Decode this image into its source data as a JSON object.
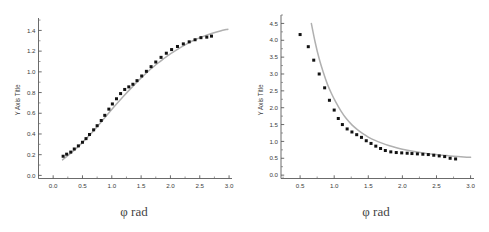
{
  "figure": {
    "background": "#ffffff",
    "marker_color": "#121212",
    "curve_color": "#b0b0b0",
    "axis_color": "#5a5a5a",
    "panel_count": 2
  },
  "chart_data": [
    {
      "id": "left-panel",
      "type": "scatter",
      "title": "",
      "subtitle": "",
      "xlabel": "φ rad",
      "ylabel": "Y Axis Title",
      "xlim": [
        -0.25,
        3.05
      ],
      "ylim": [
        -0.03,
        1.52
      ],
      "xticks": [
        "0.0",
        "0.5",
        "1.0",
        "1.5",
        "2.0",
        "2.5",
        "3.0"
      ],
      "xtick_values": [
        0.0,
        0.5,
        1.0,
        1.5,
        2.0,
        2.5,
        3.0
      ],
      "yticks": [
        "0.0",
        "0.2",
        "0.4",
        "0.6",
        "0.8",
        "1.0",
        "1.2",
        "1.4"
      ],
      "ytick_values": [
        0.0,
        0.2,
        0.4,
        0.6,
        0.8,
        1.0,
        1.2,
        1.4
      ],
      "minor_ticks": true,
      "grid": false,
      "legend": "none",
      "axes_style": "L-shaped spines, inward ticks",
      "series": [
        {
          "name": "data points",
          "style": "scatter",
          "marker": "filled-square",
          "color": "#121212",
          "x": [
            0.17,
            0.23,
            0.3,
            0.36,
            0.43,
            0.5,
            0.56,
            0.62,
            0.69,
            0.75,
            0.82,
            0.88,
            0.95,
            1.01,
            1.08,
            1.15,
            1.22,
            1.29,
            1.36,
            1.43,
            1.51,
            1.59,
            1.67,
            1.75,
            1.84,
            1.93,
            2.02,
            2.12,
            2.22,
            2.32,
            2.42,
            2.52,
            2.62,
            2.7
          ],
          "y": [
            0.185,
            0.205,
            0.225,
            0.255,
            0.285,
            0.32,
            0.355,
            0.395,
            0.44,
            0.48,
            0.53,
            0.58,
            0.64,
            0.69,
            0.74,
            0.79,
            0.83,
            0.855,
            0.88,
            0.915,
            0.96,
            1.005,
            1.05,
            1.095,
            1.14,
            1.18,
            1.215,
            1.245,
            1.27,
            1.29,
            1.31,
            1.33,
            1.335,
            1.345
          ]
        },
        {
          "name": "fit curve",
          "style": "line",
          "color": "#b0b0b0",
          "x": [
            0.16,
            0.3,
            0.45,
            0.6,
            0.75,
            0.9,
            1.05,
            1.2,
            1.35,
            1.5,
            1.65,
            1.8,
            1.95,
            2.1,
            2.25,
            2.4,
            2.55,
            2.7,
            2.85,
            2.98
          ],
          "y": [
            0.15,
            0.215,
            0.29,
            0.375,
            0.47,
            0.57,
            0.67,
            0.765,
            0.855,
            0.94,
            1.02,
            1.09,
            1.155,
            1.21,
            1.26,
            1.305,
            1.34,
            1.37,
            1.395,
            1.412
          ]
        }
      ]
    },
    {
      "id": "right-panel",
      "type": "scatter",
      "title": "",
      "subtitle": "",
      "xlabel": "φ rad",
      "ylabel": "Y Axis Title",
      "xlim": [
        0.22,
        3.05
      ],
      "ylim": [
        -0.1,
        4.75
      ],
      "xticks": [
        "0.5",
        "1.0",
        "1.5",
        "2.0",
        "2.5",
        "3.0"
      ],
      "xtick_values": [
        0.5,
        1.0,
        1.5,
        2.0,
        2.5,
        3.0
      ],
      "yticks": [
        "0.0",
        "0.5",
        "1.0",
        "1.5",
        "2.0",
        "2.5",
        "3.0",
        "3.5",
        "4.0",
        "4.5"
      ],
      "ytick_values": [
        0.0,
        0.5,
        1.0,
        1.5,
        2.0,
        2.5,
        3.0,
        3.5,
        4.0,
        4.5
      ],
      "minor_ticks": true,
      "grid": false,
      "legend": "none",
      "axes_style": "L-shaped spines, inward ticks",
      "series": [
        {
          "name": "data points",
          "style": "scatter",
          "marker": "filled-square",
          "color": "#121212",
          "x": [
            0.5,
            0.62,
            0.7,
            0.78,
            0.86,
            0.93,
            1.0,
            1.06,
            1.12,
            1.19,
            1.26,
            1.33,
            1.4,
            1.47,
            1.54,
            1.61,
            1.68,
            1.75,
            1.83,
            1.91,
            1.99,
            2.07,
            2.14,
            2.22,
            2.3,
            2.38,
            2.46,
            2.54,
            2.62,
            2.7,
            2.78
          ],
          "y": [
            4.17,
            3.81,
            3.41,
            3.0,
            2.59,
            2.22,
            1.93,
            1.68,
            1.5,
            1.37,
            1.28,
            1.2,
            1.12,
            1.02,
            0.94,
            0.86,
            0.79,
            0.73,
            0.69,
            0.67,
            0.66,
            0.65,
            0.64,
            0.63,
            0.62,
            0.61,
            0.59,
            0.57,
            0.55,
            0.5,
            0.48
          ]
        },
        {
          "name": "fit curve",
          "style": "line",
          "color": "#b0b0b0",
          "x": [
            0.665,
            0.72,
            0.78,
            0.84,
            0.9,
            0.96,
            1.02,
            1.1,
            1.18,
            1.26,
            1.34,
            1.42,
            1.5,
            1.6,
            1.7,
            1.8,
            1.9,
            2.0,
            2.15,
            2.3,
            2.45,
            2.6,
            2.75,
            2.9,
            3.0
          ],
          "y": [
            4.5,
            3.95,
            3.45,
            3.05,
            2.7,
            2.42,
            2.18,
            1.9,
            1.67,
            1.49,
            1.35,
            1.23,
            1.13,
            1.03,
            0.95,
            0.88,
            0.82,
            0.77,
            0.71,
            0.66,
            0.62,
            0.59,
            0.56,
            0.54,
            0.53
          ]
        }
      ]
    }
  ]
}
